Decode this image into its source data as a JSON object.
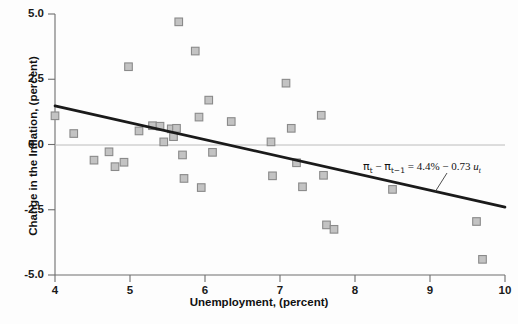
{
  "chart_data": {
    "type": "scatter",
    "title": "",
    "xlabel": "Unemployment, (percent)",
    "ylabel": "Change in the Inflation, (percent)",
    "xlim": [
      4,
      10
    ],
    "ylim": [
      -5.0,
      5.0
    ],
    "xticks": [
      4,
      5,
      6,
      7,
      8,
      9,
      10
    ],
    "xtick_labels": [
      "4",
      "5",
      "6",
      "7",
      "8",
      "9",
      "10"
    ],
    "yticks": [
      -5.0,
      -2.5,
      0.0,
      2.5,
      5.0
    ],
    "ytick_labels": [
      "-5.0",
      "-2.5",
      "0.0",
      "2.5",
      "5.0"
    ],
    "grid": false,
    "zero_line": true,
    "legend": "none",
    "marker": {
      "shape": "square",
      "fill": "#c3c3c3",
      "edge": "#8a8a8a"
    },
    "points": [
      {
        "x": 4.0,
        "y": 1.1
      },
      {
        "x": 4.25,
        "y": 0.42
      },
      {
        "x": 4.52,
        "y": -0.6
      },
      {
        "x": 4.72,
        "y": -0.28
      },
      {
        "x": 4.8,
        "y": -0.85
      },
      {
        "x": 4.92,
        "y": -0.68
      },
      {
        "x": 4.98,
        "y": 2.98
      },
      {
        "x": 5.12,
        "y": 0.52
      },
      {
        "x": 5.3,
        "y": 0.72
      },
      {
        "x": 5.4,
        "y": 0.7
      },
      {
        "x": 5.45,
        "y": 0.1
      },
      {
        "x": 5.55,
        "y": 0.6
      },
      {
        "x": 5.58,
        "y": 0.3
      },
      {
        "x": 5.62,
        "y": 0.62
      },
      {
        "x": 5.65,
        "y": 4.7
      },
      {
        "x": 5.7,
        "y": -0.4
      },
      {
        "x": 5.72,
        "y": -1.3
      },
      {
        "x": 5.87,
        "y": 3.58
      },
      {
        "x": 5.92,
        "y": 1.05
      },
      {
        "x": 5.95,
        "y": -1.65
      },
      {
        "x": 6.05,
        "y": 1.7
      },
      {
        "x": 6.1,
        "y": -0.3
      },
      {
        "x": 6.35,
        "y": 0.88
      },
      {
        "x": 6.88,
        "y": 0.1
      },
      {
        "x": 6.9,
        "y": -1.2
      },
      {
        "x": 7.08,
        "y": 2.35
      },
      {
        "x": 7.15,
        "y": 0.62
      },
      {
        "x": 7.22,
        "y": -0.7
      },
      {
        "x": 7.3,
        "y": -1.62
      },
      {
        "x": 7.55,
        "y": 1.12
      },
      {
        "x": 7.58,
        "y": -1.18
      },
      {
        "x": 7.62,
        "y": -3.08
      },
      {
        "x": 7.72,
        "y": -3.25
      },
      {
        "x": 8.5,
        "y": -1.72
      },
      {
        "x": 9.62,
        "y": -2.95
      },
      {
        "x": 9.7,
        "y": -4.4
      }
    ],
    "trendline": {
      "x_start": 4.0,
      "y_start": 1.48,
      "x_end": 10.0,
      "y_end": -2.4,
      "equation_parts": {
        "lhs_pi": "π",
        "lhs_sub1": "t",
        "minus": "−",
        "lhs_sub2": "t−1",
        "equals": "=",
        "intercept": "4.4%",
        "slope": "0.73",
        "var": "u",
        "var_sub": "t"
      },
      "equation_text": "πt − πt−1 = 4.4% − 0.73 ut"
    }
  },
  "colors": {
    "marker_fill": "#c3c3c3",
    "marker_edge": "#8a8a8a",
    "trendline": "#1a1a1a",
    "axis": "#6e6e6e",
    "zero_line": "#b5b5b5",
    "text": "#111111",
    "background": "#fdfdfd"
  }
}
